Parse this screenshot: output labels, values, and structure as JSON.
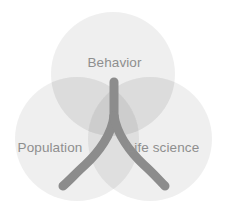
{
  "diagram": {
    "type": "venn",
    "title": "",
    "canvas": {
      "width": 227,
      "height": 215,
      "background": "#ffffff"
    },
    "sets": [
      {
        "id": "behavior",
        "label": "Behavior",
        "position": "top",
        "center": {
          "x": 113,
          "y": 74
        },
        "radius": 62,
        "fill": "#e9e9e9",
        "opacity": 0.62
      },
      {
        "id": "population",
        "label": "Population",
        "position": "bottom-left",
        "center": {
          "x": 77,
          "y": 139
        },
        "radius": 62,
        "fill": "#e9e9e9",
        "opacity": 0.62
      },
      {
        "id": "life-science",
        "label": "Life science",
        "position": "bottom-right",
        "center": {
          "x": 150,
          "y": 139
        },
        "radius": 62,
        "fill": "#e9e9e9",
        "opacity": 0.62
      }
    ],
    "overlay": {
      "id": "wishbone",
      "shape": "y-shape",
      "description": "Three-pronged Y / wishbone converging at center",
      "stroke": "#8c8c8c",
      "stroke_width": 9,
      "stem_top": {
        "x": 114,
        "y": 81
      },
      "branch_left_end": {
        "x": 62,
        "y": 186
      },
      "branch_right_end": {
        "x": 165,
        "y": 186
      }
    },
    "palette": {
      "circle_fill": "#e9e9e9",
      "overlap_two": "#d8d8d8",
      "overlap_three": "#cfcfcf",
      "label_color": "#8e8e8e",
      "wishbone_stroke": "#8c8c8c",
      "background": "#ffffff"
    },
    "labels": {
      "behavior": "Behavior",
      "population": "Population",
      "life_science": "Life science"
    }
  }
}
